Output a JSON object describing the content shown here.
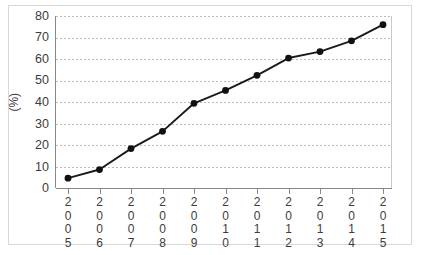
{
  "chart_data": {
    "type": "line",
    "title": "",
    "xlabel": "",
    "ylabel": "(%)",
    "categories": [
      "2005",
      "2006",
      "2007",
      "2008",
      "2009",
      "2010",
      "2011",
      "2012",
      "2013",
      "2014",
      "2015"
    ],
    "values": [
      4.8,
      8.8,
      18.5,
      26.5,
      39.5,
      45.5,
      52.5,
      60.5,
      63.5,
      68.5,
      76.0
    ],
    "series": [
      {
        "name": "",
        "values": [
          4.8,
          8.8,
          18.5,
          26.5,
          39.5,
          45.5,
          52.5,
          60.5,
          63.5,
          68.5,
          76.0
        ]
      }
    ],
    "ylim": [
      0,
      80
    ],
    "ytick_labels": [
      "0",
      "10",
      "20",
      "30",
      "40",
      "50",
      "60",
      "70",
      "80"
    ],
    "ytick_values": [
      0,
      10,
      20,
      30,
      40,
      50,
      60,
      70,
      80
    ],
    "grid": true,
    "grid_axis": "y",
    "legend": false,
    "legend_position": "none",
    "marker": "filled-circle",
    "line_color": "#1a1a1a",
    "marker_color": "#111111",
    "grid_color": "#bdbdbd",
    "axis_color": "#888888",
    "frame_color": "#d8d8d8",
    "background_color": "#ffffff",
    "xtick_label_orientation": "vertical-stacked-digits"
  }
}
